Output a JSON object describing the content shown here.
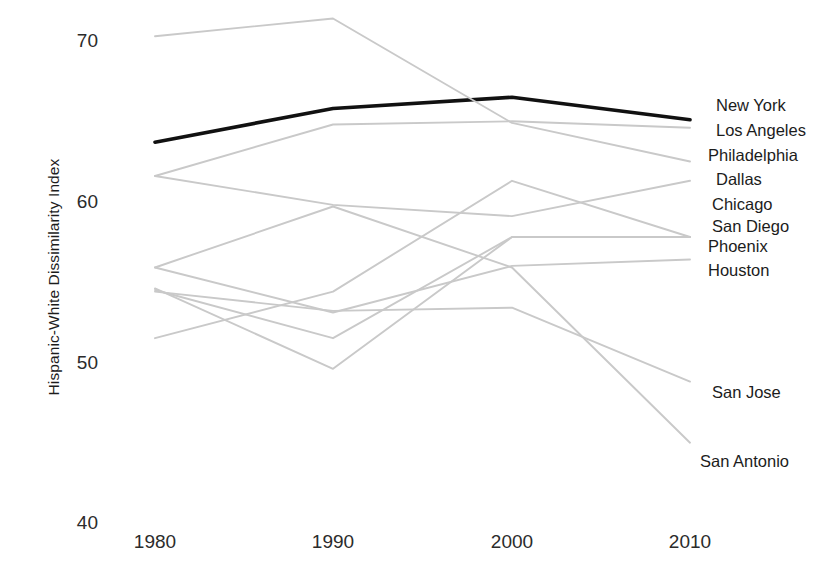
{
  "chart_data": {
    "type": "line",
    "title": "",
    "subtitle": "",
    "xlabel": "",
    "ylabel": "Hispanic-White Dissimilarity Index",
    "x": [
      1980,
      1990,
      2000,
      2010
    ],
    "xtick_labels": [
      "1980",
      "1990",
      "2000",
      "2010"
    ],
    "ytick_labels": [
      "70",
      "60",
      "50",
      "40"
    ],
    "yticks": [
      70,
      60,
      50,
      40
    ],
    "ylim": [
      40,
      72
    ],
    "xlim": [
      1978,
      2012
    ],
    "grid": false,
    "legend_position": "right-inline-labels",
    "highlight_color": "#111111",
    "other_color": "#c9c9c9",
    "series": [
      {
        "name": "New York",
        "values": [
          63.7,
          65.8,
          66.5,
          65.1
        ],
        "highlighted": true,
        "color": "#111111",
        "label": "New York"
      },
      {
        "name": "Los Angeles",
        "values": [
          61.6,
          64.8,
          65.0,
          64.6
        ],
        "highlighted": false,
        "color": "#c9c9c9",
        "label": "Los Angeles"
      },
      {
        "name": "Philadelphia",
        "values": [
          70.3,
          71.4,
          64.9,
          62.5
        ],
        "highlighted": false,
        "color": "#c9c9c9",
        "label": "Philadelphia"
      },
      {
        "name": "Dallas",
        "values": [
          51.5,
          54.4,
          61.3,
          57.8
        ],
        "highlighted": false,
        "color": "#c9c9c9",
        "label": "Dallas"
      },
      {
        "name": "Chicago",
        "values": [
          61.6,
          59.8,
          59.1,
          61.3
        ],
        "highlighted": false,
        "color": "#c9c9c9",
        "label": "Chicago"
      },
      {
        "name": "San Diego",
        "values": [
          54.5,
          51.5,
          57.8,
          57.8
        ],
        "highlighted": false,
        "color": "#c9c9c9",
        "label": "San Diego"
      },
      {
        "name": "Phoenix",
        "values": [
          55.9,
          53.1,
          56.0,
          56.4
        ],
        "highlighted": false,
        "color": "#c9c9c9",
        "label": "Phoenix"
      },
      {
        "name": "Houston",
        "values": [
          54.6,
          49.6,
          57.8,
          57.8
        ],
        "highlighted": false,
        "color": "#c9c9c9",
        "label": "Houston"
      },
      {
        "name": "San Jose",
        "values": [
          54.4,
          53.2,
          53.4,
          48.8
        ],
        "highlighted": false,
        "color": "#c9c9c9",
        "label": "San Jose"
      },
      {
        "name": "San Antonio",
        "values": [
          55.9,
          59.7,
          55.9,
          45.0
        ],
        "highlighted": false,
        "color": "#c9c9c9",
        "label": "San Antonio"
      }
    ],
    "series_labels": [
      {
        "text": "New York",
        "x": 716,
        "y": 97
      },
      {
        "text": "Los Angeles",
        "x": 716,
        "y": 122
      },
      {
        "text": "Philadelphia",
        "x": 708,
        "y": 147
      },
      {
        "text": "Dallas",
        "x": 716,
        "y": 171
      },
      {
        "text": "Chicago",
        "x": 712,
        "y": 196
      },
      {
        "text": "San Diego",
        "x": 712,
        "y": 218
      },
      {
        "text": "Phoenix",
        "x": 708,
        "y": 238
      },
      {
        "text": "Houston",
        "x": 708,
        "y": 262
      },
      {
        "text": "San Jose",
        "x": 712,
        "y": 384
      },
      {
        "text": "San Antonio",
        "x": 700,
        "y": 453
      }
    ]
  },
  "axis": {
    "y_title": "Hispanic-White Dissimilarity Index",
    "yticks": [
      {
        "label": "70",
        "y": 41
      },
      {
        "label": "60",
        "y": 202
      },
      {
        "label": "50",
        "y": 363
      },
      {
        "label": "40",
        "y": 523
      }
    ],
    "xticks": [
      {
        "label": "1980",
        "x": 155
      },
      {
        "label": "1990",
        "x": 333
      },
      {
        "label": "2000",
        "x": 512
      },
      {
        "label": "2010",
        "x": 690
      }
    ]
  }
}
